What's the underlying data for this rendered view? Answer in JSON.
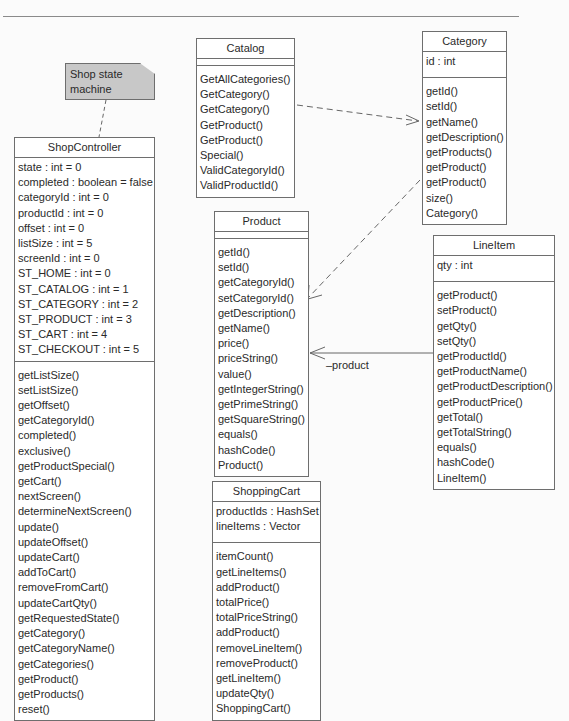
{
  "note": {
    "text_line1": "Shop state",
    "text_line2": "machine"
  },
  "classes": {
    "shop_controller": {
      "name": "ShopController",
      "attributes": [
        "state : int = 0",
        "completed : boolean = false",
        "categoryId : int = 0",
        "productId : int = 0",
        "offset : int = 0",
        "listSize : int = 5",
        "screenId : int = 0",
        "ST_HOME : int = 0",
        "ST_CATALOG : int = 1",
        "ST_CATEGORY : int = 2",
        "ST_PRODUCT : int = 3",
        "ST_CART : int = 4",
        "ST_CHECKOUT : int = 5"
      ],
      "operations": [
        "getListSize()",
        "setListSize()",
        "getOffset()",
        "getCategoryId()",
        "completed()",
        "exclusive()",
        "getProductSpecial()",
        "getCart()",
        "nextScreen()",
        "determineNextScreen()",
        "update()",
        "updateOffset()",
        "updateCart()",
        "addToCart()",
        "removeFromCart()",
        "updateCartQty()",
        "getRequestedState()",
        "getCategory()",
        "getCategoryName()",
        "getCategories()",
        "getProduct()",
        "getProducts()",
        "reset()"
      ]
    },
    "catalog": {
      "name": "Catalog",
      "attributes": [],
      "operations": [
        "GetAllCategories()",
        "GetCategory()",
        "GetCategory()",
        "GetProduct()",
        "GetProduct()",
        "Special()",
        "ValidCategoryId()",
        "ValidProductId()"
      ]
    },
    "category": {
      "name": "Category",
      "attributes": [
        "id : int"
      ],
      "operations": [
        "getId()",
        "setId()",
        "getName()",
        "getDescription()",
        "getProducts()",
        "getProduct()",
        "getProduct()",
        "size()",
        "Category()"
      ]
    },
    "product": {
      "name": "Product",
      "attributes": [],
      "operations": [
        "getId()",
        "setId()",
        "getCategoryId()",
        "setCategoryId()",
        "getDescription()",
        "getName()",
        "price()",
        "priceString()",
        "value()",
        "getIntegerString()",
        "getPrimeString()",
        "getSquareString()",
        "equals()",
        "hashCode()",
        "Product()"
      ]
    },
    "line_item": {
      "name": "LineItem",
      "attributes": [
        "qty : int"
      ],
      "operations": [
        "getProduct()",
        "setProduct()",
        "getQty()",
        "setQty()",
        "getProductId()",
        "getProductName()",
        "getProductDescription()",
        "getProductPrice()",
        "getTotal()",
        "getTotalString()",
        "equals()",
        "hashCode()",
        "LineItem()"
      ]
    },
    "shopping_cart": {
      "name": "ShoppingCart",
      "attributes": [
        "productIds : HashSet",
        "lineItems : Vector"
      ],
      "operations": [
        "itemCount()",
        "getLineItems()",
        "addProduct()",
        "totalPrice()",
        "totalPriceString()",
        "addProduct()",
        "removeLineItem()",
        "removeProduct()",
        "getLineItem()",
        "updateQty()",
        "ShoppingCart()"
      ]
    }
  },
  "associations": {
    "lineitem_product_role": "–product"
  }
}
